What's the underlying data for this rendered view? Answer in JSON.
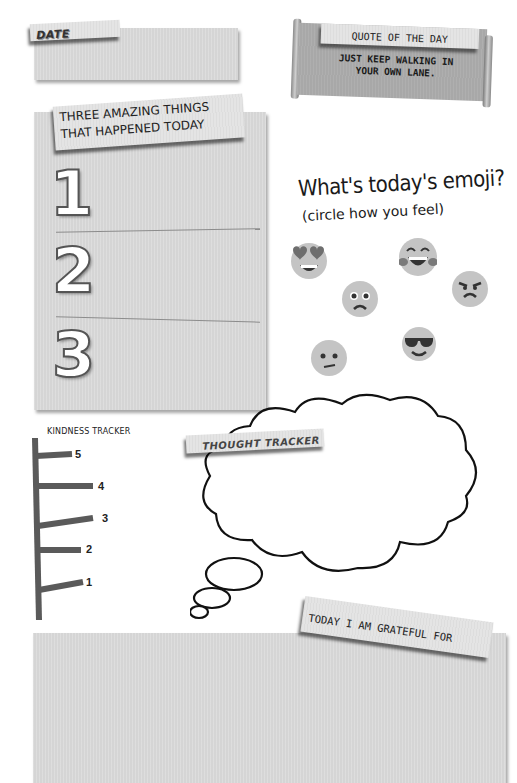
{
  "date_section": {
    "label": "DATE",
    "value": ""
  },
  "quote_section": {
    "title": "QUOTE OF THE DAY",
    "quote_line1": "JUST KEEP WALKING IN",
    "quote_line2": "YOUR OWN LANE."
  },
  "amazing_things": {
    "title_line1": "THREE AMAZING THINGS",
    "title_line2": "THAT HAPPENED TODAY",
    "items": [
      {
        "number": "1",
        "text": ""
      },
      {
        "number": "2",
        "text": ""
      },
      {
        "number": "3",
        "text": ""
      }
    ]
  },
  "emoji_section": {
    "title": "What's today's emoji?",
    "subtitle": "(circle how you feel)",
    "emojis": [
      {
        "name": "heart-eyes"
      },
      {
        "name": "laughing"
      },
      {
        "name": "angry"
      },
      {
        "name": "worried"
      },
      {
        "name": "cool-sunglasses"
      },
      {
        "name": "confused"
      }
    ]
  },
  "kindness_tracker": {
    "title": "KINDNESS TRACKER",
    "levels": [
      "5",
      "4",
      "3",
      "2",
      "1"
    ]
  },
  "thought_tracker": {
    "label": "THOUGHT TRACKER",
    "text": ""
  },
  "grateful_section": {
    "label": "TODAY I AM GRATEFUL FOR",
    "text": ""
  },
  "colors": {
    "panel": "#d9d9d9",
    "tape": "#e4e4e4",
    "ink": "#222222",
    "tracker_bar": "#5a5a5a"
  }
}
